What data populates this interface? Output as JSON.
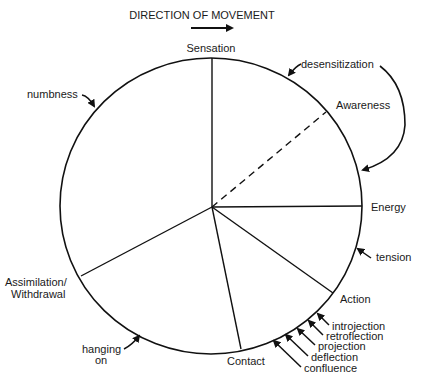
{
  "title": "DIRECTION OF MOVEMENT",
  "direction_arrow": "right-arrow",
  "stages": [
    {
      "id": "sensation",
      "label": "Sensation",
      "line": "solid"
    },
    {
      "id": "awareness",
      "label": "Awareness",
      "line": "dashed"
    },
    {
      "id": "energy",
      "label": "Energy",
      "line": "solid"
    },
    {
      "id": "action",
      "label": "Action",
      "line": "solid"
    },
    {
      "id": "contact",
      "label": "Contact",
      "line": "solid"
    },
    {
      "id": "assimilation",
      "label_line1": "Assimilation/",
      "label_line2": "Withdrawal",
      "line": "solid"
    }
  ],
  "interruptions": {
    "numbness": "numbness",
    "desensitization": "desensitization",
    "tension": "tension",
    "hanging_on_line1": "hanging",
    "hanging_on_line2": "on",
    "contact_boundary": [
      "introjection",
      "retroflection",
      "projection",
      "deflection",
      "confluence"
    ]
  }
}
